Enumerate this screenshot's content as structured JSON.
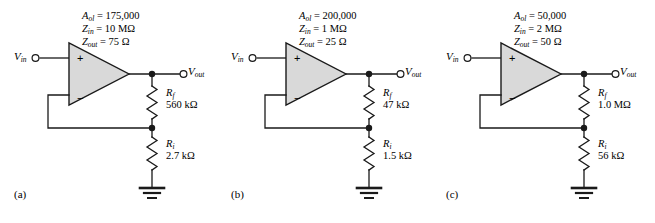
{
  "figure": {
    "type": "circuit-diagram",
    "panel_count": 3
  },
  "symbols": {
    "ohm": "Ω",
    "equals": "=",
    "A_ol": "A",
    "A_ol_sub": "ol",
    "Z_in": "Z",
    "Z_in_sub": "in",
    "Z_out": "Z",
    "Z_out_sub": "out",
    "V_in": "V",
    "V_in_sub": "in",
    "V_out": "V",
    "V_out_sub": "out",
    "R_f": "R",
    "R_f_sub": "f",
    "R_i": "R",
    "R_i_sub": "i"
  },
  "colors": {
    "wire": "#1a1a1a",
    "amp_fill": "#d9d9d9",
    "amp_stroke": "#1a1a1a",
    "background": "#ffffff",
    "text": "#000000"
  },
  "circuits": [
    {
      "id": "a",
      "panel_label": "(a)",
      "A_ol_value": "175,000",
      "Z_in_value": "10 MΩ",
      "Z_out_value": "75 Ω",
      "Rf_value": "560 kΩ",
      "Ri_value": "2.7 kΩ",
      "input_label": "V",
      "output_label": "V"
    },
    {
      "id": "b",
      "panel_label": "(b)",
      "A_ol_value": "200,000",
      "Z_in_value": "1 MΩ",
      "Z_out_value": "25 Ω",
      "Rf_value": "47 kΩ",
      "Ri_value": "1.5 kΩ",
      "input_label": "V",
      "output_label": "V"
    },
    {
      "id": "c",
      "panel_label": "(c)",
      "A_ol_value": "50,000",
      "Z_in_value": "2 MΩ",
      "Z_out_value": "50 Ω",
      "Rf_value": "1.0 MΩ",
      "Ri_value": "56 kΩ",
      "input_label": "V",
      "output_label": "V"
    }
  ],
  "opamp_terminals": {
    "noninverting": "+",
    "inverting": "−"
  }
}
